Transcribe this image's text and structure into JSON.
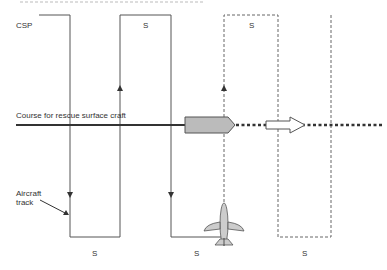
{
  "diagram": {
    "header_fragment": "…page … …",
    "labels": {
      "csp": "CSP",
      "course": "Course for rescue surface craft",
      "aircraft_track_line1": "Aircraft",
      "aircraft_track_line2": "track",
      "spacing": "S"
    },
    "top_spacing_labels": [
      "S",
      "S"
    ],
    "bottom_spacing_labels": [
      "S",
      "S",
      "S"
    ],
    "legs": {
      "solid_x": [
        70,
        120,
        171
      ],
      "dashed_x": [
        224,
        278,
        331
      ],
      "top_y": 15,
      "bottom_y": 237
    },
    "colors": {
      "line": "#555555",
      "course_line": "#333333",
      "boat_fill": "#bbbbbb",
      "arrow_fill": "#ffffff",
      "aircraft_fill": "#cccccc"
    },
    "icons": [
      "arrow-down-icon",
      "arrow-up-icon",
      "boat-icon",
      "direction-arrow-icon",
      "aircraft-icon"
    ]
  }
}
